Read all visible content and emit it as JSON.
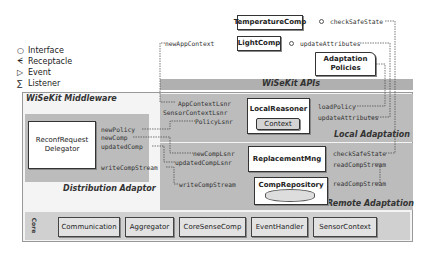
{
  "legend": [
    {
      "symbol": "○",
      "icon": "interface-icon",
      "label": "Interface"
    },
    {
      "symbol": "ᗕ",
      "icon": "receptacle-icon",
      "label": "Receptacle"
    },
    {
      "symbol": "▷",
      "icon": "event-icon",
      "label": "Event"
    },
    {
      "symbol": "∑",
      "icon": "listener-icon",
      "label": "Listener"
    }
  ],
  "top_components": {
    "temperature": {
      "name": "TemperatureComp",
      "port": "checkSafeState"
    },
    "light": {
      "name": "LightComp",
      "left_port": "newAppContext",
      "right_port": "updateAttributes"
    },
    "policies": {
      "name_line1": "Adaptation",
      "name_line2": "Policies"
    }
  },
  "apis_title": "WiSeKit APIs",
  "middleware_title": "WiSeKit Middleware",
  "distribution": {
    "title": "Distribution Adaptor",
    "component_line1": "ReconfRequest",
    "component_line2": "Delegator",
    "ports": [
      "newPolicy",
      "newComp",
      "updatedComp",
      "writeCompStream"
    ]
  },
  "local": {
    "title": "Local Adaptation",
    "component": "LocalReasoner",
    "sub": "Context",
    "left_ports": [
      "AppContextLsnr",
      "SensorContextLsnr",
      "PolicyLsnr"
    ],
    "right_ports": [
      "loadPolicy",
      "updateAttributes"
    ]
  },
  "remote": {
    "title": "Remote Adaptation",
    "replacement": "ReplacementMng",
    "repository": "CompRepository",
    "left_ports": [
      "newCompLsnr",
      "updatedCompLsnr",
      "writeCompStream"
    ],
    "right_ports": [
      "checkSafeState",
      "readCompStream",
      "readCompStream"
    ]
  },
  "core": {
    "label": "Core",
    "items": [
      "Communication",
      "Aggregator",
      "CoreSenseComp",
      "EventHandler",
      "SensorContext"
    ]
  }
}
